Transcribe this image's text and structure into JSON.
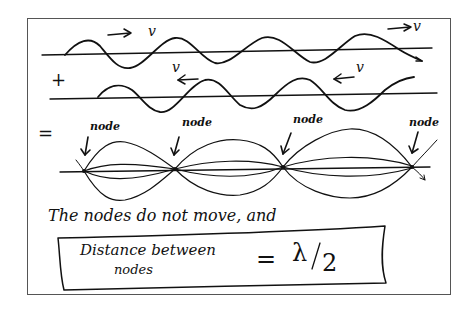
{
  "diagram": {
    "waves": {
      "top": {
        "direction": "right",
        "velocity_label": "v",
        "arrow": "→"
      },
      "bottom": {
        "direction": "left",
        "velocity_label": "v",
        "arrow": "←"
      }
    },
    "operators": {
      "plus": "+",
      "equals": "="
    },
    "standing_wave": {
      "node_label": "node",
      "node_count": 4,
      "nodes": [
        "node",
        "node",
        "node",
        "node"
      ]
    },
    "caption": "The nodes do not move, and",
    "result_box": {
      "line1": "Distance between",
      "line2": "nodes",
      "equals": "=",
      "value_symbol": "λ",
      "value_slash": "/",
      "value_denominator": "2"
    },
    "colors": {
      "ink": "#111111",
      "frame": "#555555",
      "background": "#ffffff"
    }
  }
}
